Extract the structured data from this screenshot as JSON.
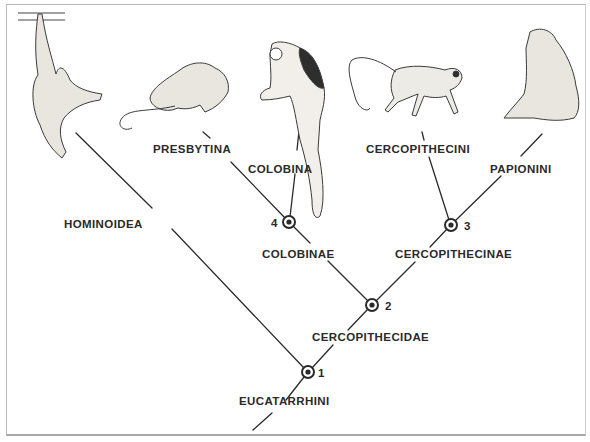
{
  "diagram": {
    "type": "cladogram",
    "nodes": [
      {
        "id": "1",
        "label": "1",
        "x": 308,
        "y": 372
      },
      {
        "id": "2",
        "label": "2",
        "x": 372,
        "y": 305
      },
      {
        "id": "3",
        "label": "3",
        "x": 451,
        "y": 225
      },
      {
        "id": "4",
        "label": "4",
        "x": 289,
        "y": 222
      }
    ],
    "taxa": {
      "hominoidea": "HOMINOIDEA",
      "presbytina": "PRESBYTINA",
      "colobina": "COLOBINA",
      "colobinae": "COLOBINAE",
      "cercopithecini": "CERCOPITHECINI",
      "papionini": "PAPIONINI",
      "cercopithecinae": "CERCOPITHECINAE",
      "cercopithecidae": "CERCOPITHECIDAE",
      "eucatarrhini": "EUCATARRHINI"
    },
    "illustrations": [
      {
        "name": "gibbon-illustration",
        "position": "top-left",
        "group": "Hominoidea"
      },
      {
        "name": "langur-illustration",
        "position": "top",
        "group": "Presbytina"
      },
      {
        "name": "colobus-illustration",
        "position": "top-center",
        "group": "Colobina"
      },
      {
        "name": "vervet-illustration",
        "position": "top-right",
        "group": "Cercopithecini"
      },
      {
        "name": "baboon-illustration",
        "position": "top-far-right",
        "group": "Papionini"
      }
    ],
    "colors": {
      "line": "#2a2a2a",
      "frame": "#b8b8b8",
      "background": "#ffffff"
    }
  }
}
